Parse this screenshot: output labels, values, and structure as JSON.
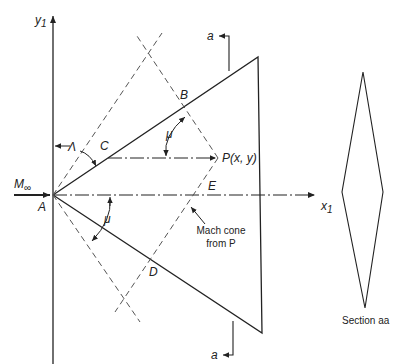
{
  "diagram": {
    "type": "supersonic-wing-planform",
    "labels": {
      "y_axis": "y",
      "y_axis_sub": "1",
      "x_axis": "x",
      "x_axis_sub": "1",
      "freestream": "M",
      "freestream_sub": "∞",
      "point_A": "A",
      "point_B": "B",
      "point_C": "C",
      "point_D": "D",
      "point_E": "E",
      "point_P": "P(x, y)",
      "sweep_angle": "Λ",
      "mach_angle_upper": "μ",
      "mach_angle_lower": "μ",
      "mach_cone_line1": "Mach cone",
      "mach_cone_line2": "from P",
      "section_marker_top": "a",
      "section_marker_bottom": "a",
      "section_caption": "Section aa"
    },
    "colors": {
      "line": "#222222",
      "dashed": "#555555"
    }
  }
}
